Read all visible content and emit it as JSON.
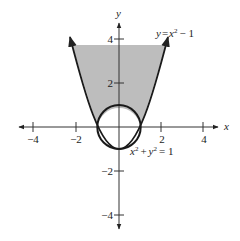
{
  "diagram": {
    "title": "",
    "axes": {
      "x_label": "x",
      "y_label": "y",
      "x_ticks": [
        {
          "value": -4,
          "label": "−4"
        },
        {
          "value": -2,
          "label": "−2"
        },
        {
          "value": 2,
          "label": "2"
        },
        {
          "value": 4,
          "label": "4"
        }
      ],
      "y_ticks": [
        {
          "value": 4,
          "label": "4"
        },
        {
          "value": 2,
          "label": "2"
        },
        {
          "value": -2,
          "label": "−2"
        },
        {
          "value": -4,
          "label": "−4"
        }
      ]
    },
    "curves": {
      "parabola": {
        "equation": "y = x² − 1",
        "label_y": "y",
        "label_eq": "=",
        "label_x": "x",
        "label_exp": "2",
        "label_rest": "− 1"
      },
      "circle": {
        "equation": "x² + y² = 1",
        "label_x": "x",
        "label_exp1": "2",
        "label_plus": "+",
        "label_y": "y",
        "label_exp2": "2",
        "label_rest": "= 1"
      }
    },
    "shaded_region": {
      "description": "region between parabola y = x² − 1 and outside circle x² + y² = 1, above x-axis",
      "color": "#bdbdbd"
    },
    "colors": {
      "axis": "#333333",
      "curve": "#1a1a1a",
      "shade": "#bdbdbd"
    }
  }
}
